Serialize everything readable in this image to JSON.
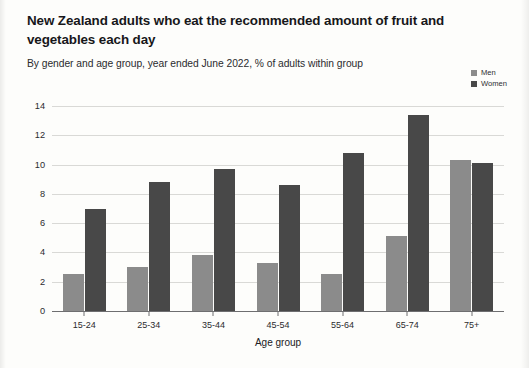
{
  "title": "New Zealand adults who eat the recommended amount of fruit and vegetables each day",
  "subtitle": "By gender and age group, year ended June 2022, % of adults within group",
  "legend": {
    "items": [
      {
        "label": "Men",
        "color": "#8b8b8b"
      },
      {
        "label": "Women",
        "color": "#484848"
      }
    ]
  },
  "chart_data": {
    "type": "bar",
    "title": "New Zealand adults who eat the recommended amount of fruit and vegetables each day",
    "subtitle": "By gender and age group, year ended June 2022, % of adults within group",
    "xlabel": "Age group",
    "ylabel": "",
    "ylim": [
      0,
      14
    ],
    "yticks": [
      0,
      2,
      4,
      6,
      8,
      10,
      12,
      14
    ],
    "grid": true,
    "legend_position": "top-right",
    "categories": [
      "15-24",
      "25-34",
      "35-44",
      "45-54",
      "55-64",
      "65-74",
      "75+"
    ],
    "series": [
      {
        "name": "Men",
        "color": "#8b8b8b",
        "values": [
          2.5,
          3.0,
          3.8,
          3.3,
          2.5,
          5.1,
          10.3
        ]
      },
      {
        "name": "Women",
        "color": "#484848",
        "values": [
          7.0,
          8.8,
          9.7,
          8.6,
          10.8,
          13.4,
          10.1
        ]
      }
    ]
  }
}
